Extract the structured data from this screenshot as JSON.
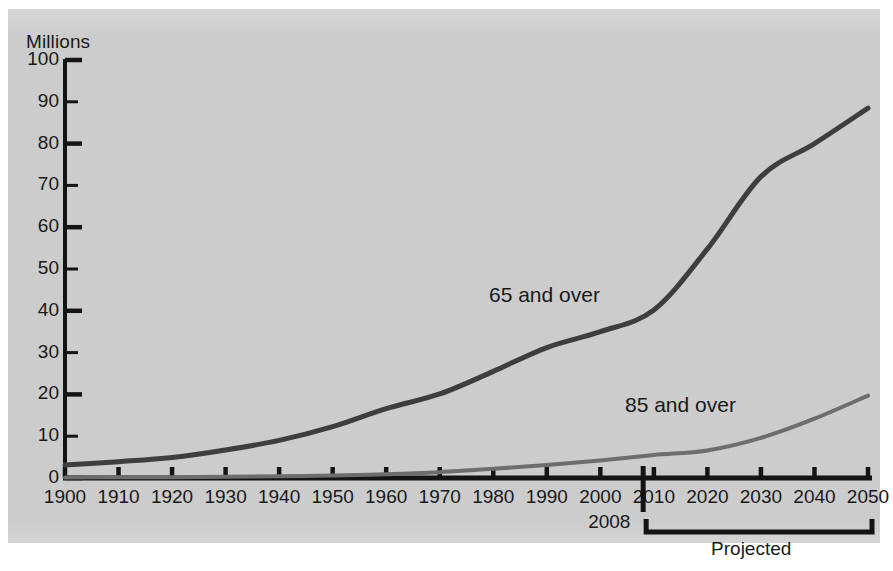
{
  "chart_data": {
    "type": "line",
    "title": "",
    "ylabel": "Millions",
    "xlabel": "",
    "ylim": [
      0,
      100
    ],
    "xlim": [
      1900,
      2050
    ],
    "grid": false,
    "legend_position": "inline-annotation",
    "y_ticks": [
      0,
      10,
      20,
      30,
      40,
      50,
      60,
      70,
      80,
      90,
      100
    ],
    "y_tick_labels": [
      "0",
      "10",
      "20",
      "30",
      "40",
      "50",
      "60",
      "70",
      "80",
      "90",
      "100"
    ],
    "x_ticks": [
      1900,
      1910,
      1920,
      1930,
      1940,
      1950,
      1960,
      1970,
      1980,
      1990,
      2000,
      2010,
      2020,
      2030,
      2040,
      2050
    ],
    "x_tick_labels": [
      "1900",
      "1910",
      "1920",
      "1930",
      "1940",
      "1950",
      "1960",
      "1970",
      "1980",
      "1990",
      "2000",
      "2010",
      "2020",
      "2030",
      "2040",
      "2050"
    ],
    "x": [
      1900,
      1910,
      1920,
      1930,
      1940,
      1950,
      1960,
      1970,
      1980,
      1990,
      2000,
      2010,
      2020,
      2030,
      2040,
      2050
    ],
    "series": [
      {
        "name": "65 and over",
        "color": "#3f3f3f",
        "values": [
          3.1,
          3.9,
          4.9,
          6.7,
          9.0,
          12.3,
          16.6,
          20.1,
          25.5,
          31.2,
          35.0,
          40.2,
          54.8,
          72.1,
          80.0,
          88.5
        ]
      },
      {
        "name": "85 and over",
        "color": "#6f6f6f",
        "values": [
          0.1,
          0.2,
          0.2,
          0.3,
          0.4,
          0.6,
          0.9,
          1.4,
          2.2,
          3.1,
          4.2,
          5.5,
          6.6,
          9.6,
          14.2,
          19.7
        ]
      }
    ],
    "annotations": [
      {
        "name": "year-marker",
        "text": "2008",
        "x": 2008,
        "type": "vertical-marker"
      },
      {
        "name": "projected-bracket",
        "text": "Projected",
        "x_start": 2008,
        "x_end": 2050,
        "type": "bracket"
      }
    ],
    "series_label_positions": [
      {
        "label": "65 and over",
        "x_px": 489,
        "y_px": 283
      },
      {
        "label": "85 and over",
        "x_px": 625,
        "y_px": 393
      }
    ]
  },
  "axis": {
    "ylabel": "Millions",
    "y_labels": [
      "100",
      "90",
      "80",
      "70",
      "60",
      "50",
      "40",
      "30",
      "20",
      "10",
      "0"
    ],
    "x_labels": [
      "1900",
      "1910",
      "1920",
      "1930",
      "1940",
      "1950",
      "1960",
      "1970",
      "1980",
      "1990",
      "2000",
      "2010",
      "2020",
      "2030",
      "2040",
      "2050"
    ]
  },
  "labels": {
    "series_65": "65 and over",
    "series_85": "85 and over",
    "marker_year": "2008",
    "projected": "Projected"
  },
  "colors": {
    "panel_background": "#cfcfcf",
    "axis": "#151515",
    "series_65": "#3f3f3f",
    "series_85": "#6f6f6f",
    "text": "#1a1a1a"
  }
}
